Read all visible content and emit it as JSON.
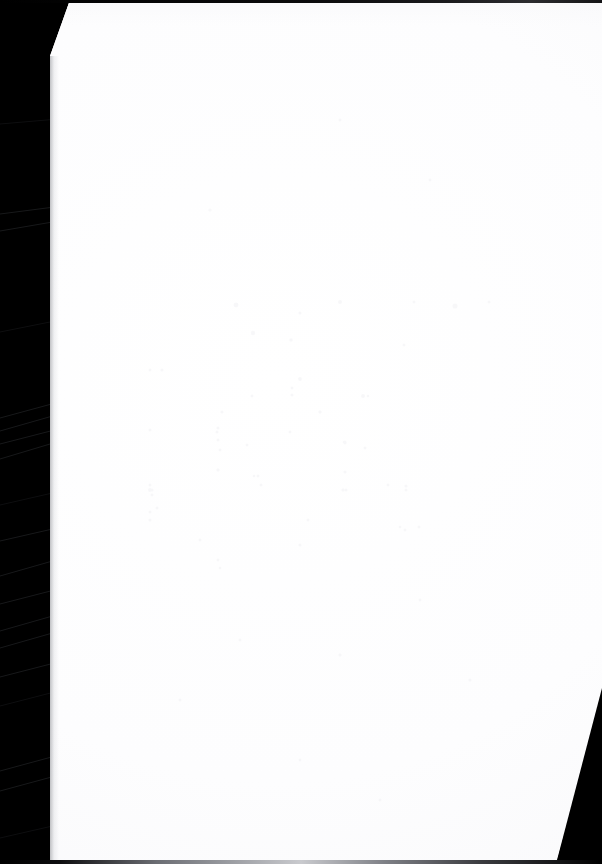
{
  "document": {
    "kind": "scanned-page",
    "title": "Scanned Blank Page",
    "page_body_text": "",
    "page_number": "",
    "header_text": "",
    "footer_text": "",
    "notes": ""
  },
  "scan": {
    "background_color": "#000000",
    "paper_color": "#ffffff",
    "edge_shadow_color": "#787a80",
    "top_line_color": "#1a1a1c",
    "bottom_line_color": "#9a9ca1",
    "wedge_color": "#000000",
    "left_margin_label": "",
    "right_wedge_label": ""
  }
}
